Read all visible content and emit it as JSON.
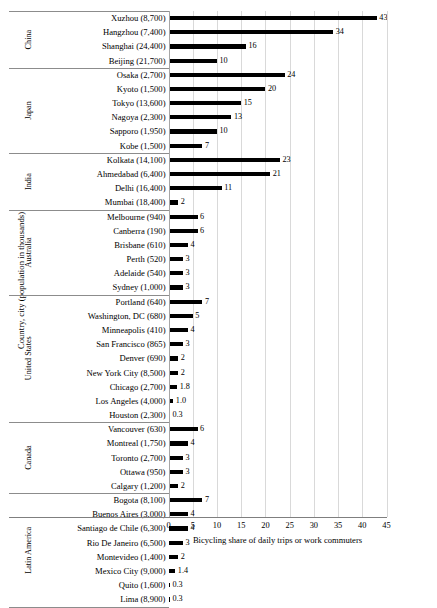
{
  "chart_data": {
    "type": "bar",
    "orientation": "horizontal",
    "title": "",
    "xlabel": "Bicycling share of daily trips or work commuters",
    "ylabel": "Country, city (population in thousands)",
    "xlim": [
      0,
      45
    ],
    "xticks": [
      0,
      5,
      10,
      15,
      20,
      25,
      30,
      35,
      40,
      45
    ],
    "grid": true,
    "legend": false,
    "bar_color": "#000000",
    "groups": [
      {
        "name": "China",
        "categories": [
          "Xuzhou (8,700)",
          "Hangzhou (7,400)",
          "Shanghai (24,400)",
          "Beijing (21,700)"
        ],
        "values": [
          43,
          34,
          16,
          10
        ],
        "labels": [
          "43",
          "34",
          "16",
          "10"
        ]
      },
      {
        "name": "Japan",
        "categories": [
          "Osaka (2,700)",
          "Kyoto (1,500)",
          "Tokyo (13,600)",
          "Nagoya (2,300)",
          "Sapporo (1,950)",
          "Kobe (1,500)"
        ],
        "values": [
          24,
          20,
          15,
          13,
          10,
          7
        ],
        "labels": [
          "24",
          "20",
          "15",
          "13",
          "10",
          "7"
        ]
      },
      {
        "name": "India",
        "categories": [
          "Kolkata (14,100)",
          "Ahmedabad (6,400)",
          "Delhi (16,400)",
          "Mumbai (18,400)"
        ],
        "values": [
          23,
          21,
          11,
          2
        ],
        "labels": [
          "23",
          "21",
          "11",
          "2"
        ]
      },
      {
        "name": "Australia",
        "categories": [
          "Melbourne (940)",
          "Canberra (190)",
          "Brisbane (610)",
          "Perth (520)",
          "Adelaide (540)",
          "Sydney (1,000)"
        ],
        "values": [
          6,
          6,
          4,
          3,
          3,
          3
        ],
        "labels": [
          "6",
          "6",
          "4",
          "3",
          "3",
          "3"
        ]
      },
      {
        "name": "United States",
        "categories": [
          "Portland (640)",
          "Washington, DC (680)",
          "Minneapolis (410)",
          "San Francisco (865)",
          "Denver (690)",
          "New York City (8,500)",
          "Chicago (2,700)",
          "Los Angeles (4,000)",
          "Houston (2,300)"
        ],
        "values": [
          7,
          5,
          4,
          3,
          2,
          2,
          1.8,
          1.0,
          0.3
        ],
        "labels": [
          "7",
          "5",
          "4",
          "3",
          "2",
          "2",
          "1.8",
          "1.0",
          "0.3"
        ]
      },
      {
        "name": "Canada",
        "categories": [
          "Vancouver (630)",
          "Montreal (1,750)",
          "Toronto (2,700)",
          "Ottawa (950)",
          "Calgary (1,200)"
        ],
        "values": [
          6,
          4,
          3,
          3,
          2
        ],
        "labels": [
          "6",
          "4",
          "3",
          "3",
          "2"
        ]
      },
      {
        "name": "Latin America",
        "categories": [
          "Bogota (8,100)",
          "Buenos Aires (3,000)",
          "Santiago de Chile (6,300)",
          "Rio De Janeiro (6,500)",
          "Montevideo (1,400)",
          "Mexico City (9,000)",
          "Quito (1,600)",
          "Lima (8,900)"
        ],
        "values": [
          7,
          4,
          4,
          3,
          2,
          1.4,
          0.3,
          0.3
        ],
        "labels": [
          "7",
          "4",
          "4",
          "3",
          "2",
          "1.4",
          "0.3",
          "0.3"
        ]
      }
    ]
  }
}
